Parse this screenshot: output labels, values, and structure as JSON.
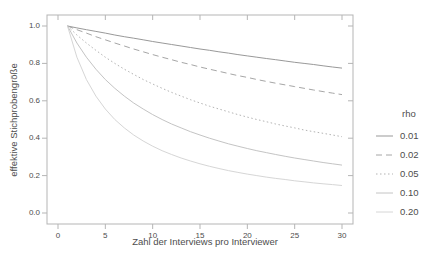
{
  "figure": {
    "background": "#ffffff"
  },
  "colors": {
    "axis_frame": "#b5b5b5",
    "text": "#4d4d4d"
  },
  "chart_data": {
    "type": "line",
    "title": "",
    "xlabel": "Zahl der Interviews pro Interviewer",
    "ylabel": "effektive Stichprobengröße",
    "xlim": [
      -1.2,
      31.2
    ],
    "ylim": [
      -0.06,
      1.06
    ],
    "grid": false,
    "x_ticks": [
      0,
      5,
      10,
      15,
      20,
      25,
      30
    ],
    "x_tick_labels": [
      "0",
      "5",
      "10",
      "15",
      "20",
      "25",
      "30"
    ],
    "y_ticks": [
      1.0,
      0.8,
      0.6,
      0.4,
      0.2,
      0.0
    ],
    "y_tick_labels": [
      "1.0",
      "0.8",
      "0.6",
      "0.4",
      "0.2",
      "0.0"
    ],
    "legend": {
      "title": "rho",
      "position": "right"
    },
    "x": [
      1,
      2,
      3,
      4,
      5,
      6,
      7,
      8,
      9,
      10,
      11,
      12,
      13,
      14,
      15,
      16,
      17,
      18,
      19,
      20,
      21,
      22,
      23,
      24,
      25,
      26,
      27,
      28,
      29,
      30
    ],
    "series": [
      {
        "name": "0.01",
        "rho": 0.01,
        "line_style": "solid",
        "color": "#999999",
        "values": [
          1.0,
          0.99,
          0.98,
          0.971,
          0.962,
          0.952,
          0.943,
          0.935,
          0.926,
          0.917,
          0.909,
          0.901,
          0.893,
          0.885,
          0.877,
          0.87,
          0.862,
          0.855,
          0.847,
          0.84,
          0.833,
          0.826,
          0.82,
          0.813,
          0.806,
          0.8,
          0.794,
          0.787,
          0.781,
          0.775
        ]
      },
      {
        "name": "0.02",
        "rho": 0.02,
        "line_style": "dashed",
        "color": "#a6a6a6",
        "values": [
          1.0,
          0.98,
          0.962,
          0.943,
          0.926,
          0.909,
          0.893,
          0.877,
          0.862,
          0.847,
          0.833,
          0.82,
          0.806,
          0.794,
          0.781,
          0.769,
          0.758,
          0.746,
          0.735,
          0.725,
          0.714,
          0.704,
          0.694,
          0.685,
          0.676,
          0.667,
          0.658,
          0.649,
          0.641,
          0.633
        ]
      },
      {
        "name": "0.05",
        "rho": 0.05,
        "line_style": "dotted",
        "color": "#b3b3b3",
        "values": [
          1.0,
          0.952,
          0.909,
          0.87,
          0.833,
          0.8,
          0.769,
          0.741,
          0.714,
          0.69,
          0.667,
          0.645,
          0.625,
          0.606,
          0.588,
          0.571,
          0.556,
          0.541,
          0.526,
          0.513,
          0.5,
          0.488,
          0.476,
          0.465,
          0.455,
          0.444,
          0.435,
          0.426,
          0.417,
          0.408
        ]
      },
      {
        "name": "0.10",
        "rho": 0.1,
        "line_style": "solid",
        "color": "#c4c4c4",
        "values": [
          1.0,
          0.909,
          0.833,
          0.769,
          0.714,
          0.667,
          0.625,
          0.588,
          0.556,
          0.526,
          0.5,
          0.476,
          0.455,
          0.435,
          0.417,
          0.4,
          0.385,
          0.37,
          0.357,
          0.345,
          0.333,
          0.323,
          0.313,
          0.303,
          0.294,
          0.286,
          0.278,
          0.27,
          0.263,
          0.256
        ]
      },
      {
        "name": "0.20",
        "rho": 0.2,
        "line_style": "solid",
        "color": "#d6d6d6",
        "values": [
          1.0,
          0.833,
          0.714,
          0.625,
          0.556,
          0.5,
          0.455,
          0.417,
          0.385,
          0.357,
          0.333,
          0.313,
          0.294,
          0.278,
          0.263,
          0.25,
          0.238,
          0.227,
          0.217,
          0.208,
          0.2,
          0.192,
          0.185,
          0.179,
          0.172,
          0.167,
          0.161,
          0.156,
          0.152,
          0.147
        ]
      }
    ]
  }
}
